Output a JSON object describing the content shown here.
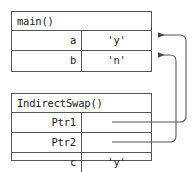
{
  "diagram": {
    "colors": {
      "border": "#555555",
      "text": "#1a1a1a",
      "arrow": "#555555",
      "background": "#ffffff"
    },
    "frames": [
      {
        "id": "main",
        "title": "main()",
        "rows": [
          {
            "name": "a",
            "value": "'y'",
            "has_pointer": false
          },
          {
            "name": "b",
            "value": "'n'",
            "has_pointer": false
          }
        ]
      },
      {
        "id": "indirect_swap",
        "title": "IndirectSwap()",
        "rows": [
          {
            "name": "Ptr1",
            "value": "",
            "has_pointer": true
          },
          {
            "name": "Ptr2",
            "value": "",
            "has_pointer": true
          },
          {
            "name": "c",
            "value": "'y'",
            "has_pointer": false
          }
        ]
      }
    ],
    "pointers": [
      {
        "from": "Ptr1",
        "to": "a"
      },
      {
        "from": "Ptr2",
        "to": "b"
      }
    ]
  }
}
